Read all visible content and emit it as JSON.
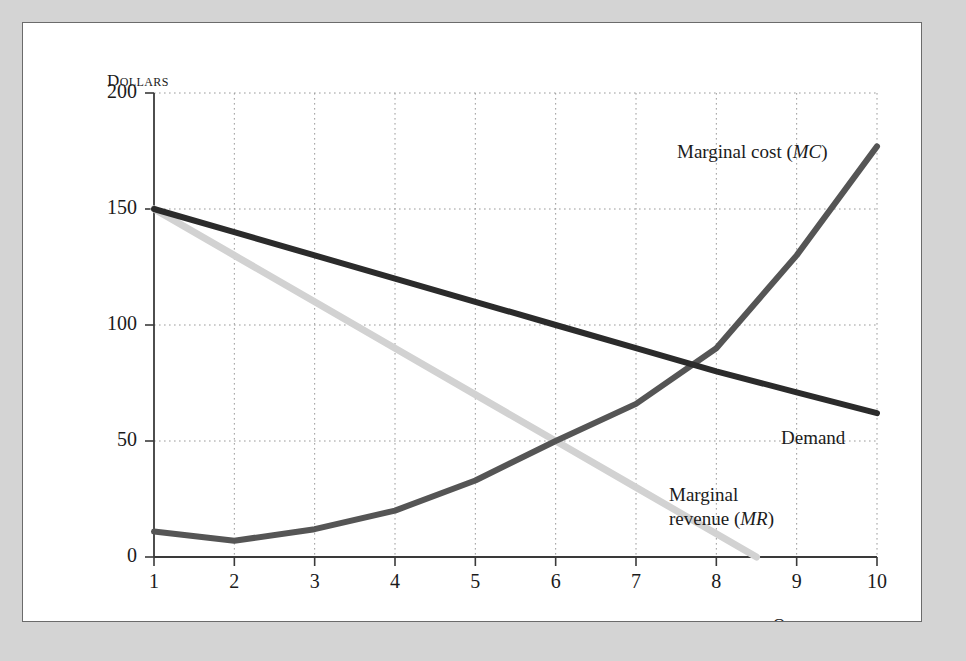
{
  "figure": {
    "background_color": "#d4d4d4",
    "panel_color": "#ffffff",
    "panel_border_color": "#6b6b6b"
  },
  "axes": {
    "y_title": "Dollars",
    "x_title": "Quantity",
    "y_ticks": [
      "0",
      "50",
      "100",
      "150",
      "200"
    ],
    "x_ticks": [
      "1",
      "2",
      "3",
      "4",
      "5",
      "6",
      "7",
      "8",
      "9",
      "10"
    ]
  },
  "labels": {
    "mc_prefix": "Marginal cost (",
    "mc_italic": "MC",
    "mc_suffix": ")",
    "demand": "Demand",
    "mr_line1": "Marginal",
    "mr_line2_prefix": "revenue (",
    "mr_italic": "MR",
    "mr_suffix": ")"
  },
  "colors": {
    "demand": "#2b2b2b",
    "marginal_cost": "#555555",
    "marginal_revenue": "#d2d2d2",
    "grid": "#9a9a9a",
    "axis": "#3a3a3a"
  },
  "chart_data": {
    "type": "line",
    "title": "",
    "xlabel": "Quantity",
    "ylabel": "Dollars",
    "xlim": [
      1,
      10
    ],
    "ylim": [
      0,
      200
    ],
    "y_ticks": [
      0,
      50,
      100,
      150,
      200
    ],
    "x_ticks": [
      1,
      2,
      3,
      4,
      5,
      6,
      7,
      8,
      9,
      10
    ],
    "grid": true,
    "grid_style": "dotted",
    "legend": "inline-annotations",
    "x": [
      1,
      2,
      3,
      4,
      5,
      6,
      7,
      8,
      9,
      10
    ],
    "series": [
      {
        "name": "Demand",
        "label": "Demand",
        "color": "#2b2b2b",
        "values": [
          150,
          140,
          130,
          120,
          110,
          100,
          90,
          80,
          71,
          62
        ]
      },
      {
        "name": "Marginal cost (MC)",
        "label": "Marginal cost (MC)",
        "color": "#555555",
        "values": [
          11,
          7,
          12,
          20,
          33,
          50,
          66,
          90,
          130,
          177
        ]
      },
      {
        "name": "Marginal revenue (MR)",
        "label": "Marginal revenue (MR)",
        "color": "#d2d2d2",
        "x": [
          1,
          2,
          3,
          4,
          5,
          6,
          7,
          8,
          8.5
        ],
        "values": [
          150,
          130,
          110,
          90,
          70,
          50,
          30,
          10,
          0
        ]
      }
    ],
    "annotations": [
      {
        "text": "Marginal cost (MC)",
        "x": 7.4,
        "y": 176
      },
      {
        "text": "Demand",
        "x": 8.6,
        "y": 71
      },
      {
        "text": "Marginal revenue (MR)",
        "x": 7.3,
        "y": 46
      }
    ],
    "intersections": [
      {
        "series": [
          "Marginal cost (MC)",
          "Marginal revenue (MR)"
        ],
        "x": 6,
        "y": 50
      },
      {
        "series": [
          "Marginal cost (MC)",
          "Demand"
        ],
        "x": 7.7,
        "y": 84
      }
    ]
  }
}
